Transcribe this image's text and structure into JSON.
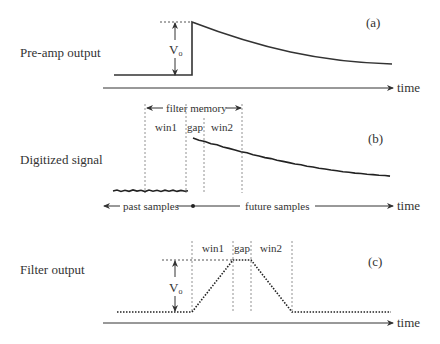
{
  "panels": {
    "a": {
      "row_label": "Pre-amp output",
      "tag": "(a)",
      "amplitude_label": "V",
      "amplitude_sub": "o",
      "axis_label": "time"
    },
    "b": {
      "row_label": "Digitized signal",
      "tag": "(b)",
      "filter_memory_label": "filter memory",
      "windows": [
        "win1",
        "gap",
        "win2"
      ],
      "past_label": "past samples",
      "future_label": "future samples",
      "axis_label": "time"
    },
    "c": {
      "row_label": "Filter output",
      "tag": "(c)",
      "windows": [
        "win1",
        "gap",
        "win2"
      ],
      "amplitude_label": "V",
      "amplitude_sub": "o",
      "axis_label": "time"
    }
  },
  "colors": {
    "line": "#333333",
    "text": "#333333",
    "guide": "#777777"
  }
}
